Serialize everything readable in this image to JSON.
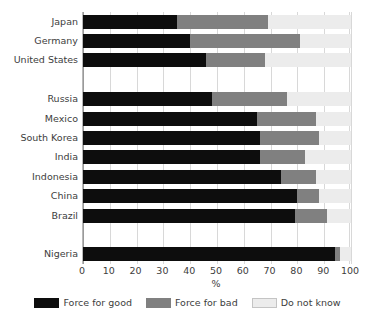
{
  "chart_data": {
    "type": "bar",
    "subtype": "stacked-horizontal",
    "title": "",
    "xlabel": "%",
    "ylabel": "",
    "xlim": [
      0,
      100
    ],
    "xticks": [
      0,
      10,
      20,
      30,
      40,
      50,
      60,
      70,
      80,
      90,
      100
    ],
    "xticklabels": [
      "0",
      "10",
      "20",
      "30",
      "40",
      "50",
      "60",
      "70",
      "80",
      "90",
      "100"
    ],
    "grid": true,
    "grid_axis": "x",
    "legend_position": "bottom",
    "categories": [
      "Japan",
      "Germany",
      "United States",
      "Russia",
      "Mexico",
      "South Korea",
      "India",
      "Indonesia",
      "China",
      "Brazil",
      "Nigeria"
    ],
    "series": [
      {
        "name": "Force for good",
        "color": "#0d0d0d",
        "values": [
          35,
          40,
          46,
          48,
          65,
          66,
          66,
          74,
          80,
          79,
          94
        ]
      },
      {
        "name": "Force for bad",
        "color": "#808080",
        "values": [
          34,
          41,
          22,
          28,
          22,
          22,
          17,
          13,
          8,
          12,
          2
        ]
      },
      {
        "name": "Do not know",
        "color": "#ececec",
        "values": [
          31,
          19,
          32,
          24,
          13,
          12,
          17,
          13,
          12,
          9,
          4
        ]
      }
    ],
    "group_gaps_after": [
      "United States",
      "Brazil"
    ]
  },
  "axis": {
    "x_title": "%",
    "tick_labels": [
      "0",
      "10",
      "20",
      "30",
      "40",
      "50",
      "60",
      "70",
      "80",
      "90",
      "100"
    ]
  },
  "legend": {
    "items": [
      {
        "label": "Force for good",
        "swatch": "legend-swatch-good"
      },
      {
        "label": "Force for bad",
        "swatch": "legend-swatch-bad"
      },
      {
        "label": "Do not know",
        "swatch": "legend-swatch-do-not-know"
      }
    ]
  },
  "colors": {
    "force_for_good": "#0d0d0d",
    "force_for_bad": "#808080",
    "do_not_know": "#ececec",
    "gridline": "#d8d8d8",
    "axis": "#9a9a9a",
    "text": "#3d3d3d",
    "background": "#ffffff"
  }
}
